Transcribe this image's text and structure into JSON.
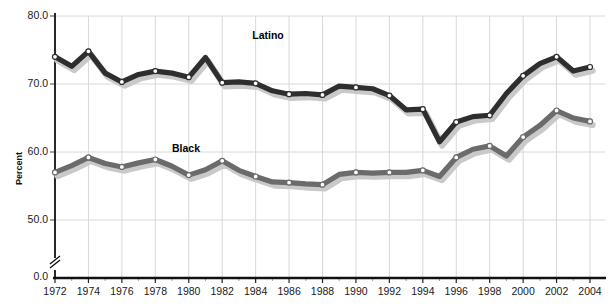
{
  "chart_data": {
    "type": "line",
    "title": "",
    "xlabel": "",
    "ylabel": "Percent",
    "ylim": [
      40,
      80
    ],
    "yticks": [
      50.0,
      60.0,
      70.0,
      80.0
    ],
    "ytick_labels": [
      "50.0",
      "60.0",
      "70.0",
      "80.0"
    ],
    "axis_break_label": "0.0",
    "xlim": [
      1972,
      2004
    ],
    "xticks": [
      1972,
      1974,
      1976,
      1978,
      1980,
      1982,
      1984,
      1986,
      1988,
      1990,
      1992,
      1994,
      1996,
      1998,
      2000,
      2002,
      2004
    ],
    "xtick_labels": [
      "1972",
      "1974",
      "1976",
      "1978",
      "1980",
      "1982",
      "1984",
      "1986",
      "1988",
      "1990",
      "1992",
      "1994",
      "1996",
      "1998",
      "2000",
      "2002",
      "2004"
    ],
    "grid": true,
    "legend": "inline-labels",
    "series": [
      {
        "name": "Latino",
        "color": "#2e2e2e",
        "label_x": 1983.8,
        "label_y": 77.0,
        "x": [
          1972,
          1973,
          1974,
          1975,
          1976,
          1977,
          1978,
          1979,
          1980,
          1981,
          1982,
          1983,
          1984,
          1985,
          1986,
          1987,
          1988,
          1989,
          1990,
          1991,
          1992,
          1993,
          1994,
          1995,
          1996,
          1997,
          1998,
          1999,
          2000,
          2001,
          2002,
          2003,
          2004
        ],
        "y": [
          74.0,
          72.6,
          74.8,
          71.6,
          70.3,
          71.4,
          71.9,
          71.6,
          71.0,
          73.9,
          70.2,
          70.3,
          70.1,
          69.0,
          68.5,
          68.6,
          68.4,
          69.7,
          69.5,
          69.3,
          68.3,
          66.2,
          66.3,
          61.5,
          64.4,
          65.2,
          65.4,
          68.6,
          71.2,
          73.0,
          74.0,
          71.9,
          72.5
        ]
      },
      {
        "name": "Black",
        "color": "#6b6b6b",
        "label_x": 1979.0,
        "label_y": 60.5,
        "x": [
          1972,
          1973,
          1974,
          1975,
          1976,
          1977,
          1978,
          1979,
          1980,
          1981,
          1982,
          1983,
          1984,
          1985,
          1986,
          1987,
          1988,
          1989,
          1990,
          1991,
          1992,
          1993,
          1994,
          1995,
          1996,
          1997,
          1998,
          1999,
          2000,
          2001,
          2002,
          2003,
          2004
        ],
        "y": [
          57.0,
          58.0,
          59.2,
          58.3,
          57.8,
          58.4,
          58.9,
          57.9,
          56.6,
          57.4,
          58.7,
          57.3,
          56.4,
          55.6,
          55.5,
          55.3,
          55.2,
          56.7,
          57.0,
          56.9,
          57.0,
          57.0,
          57.3,
          56.4,
          59.2,
          60.4,
          60.9,
          59.4,
          62.2,
          63.9,
          66.1,
          65.0,
          64.5
        ]
      }
    ]
  },
  "axis": {
    "y_axis_label": "Percent"
  }
}
